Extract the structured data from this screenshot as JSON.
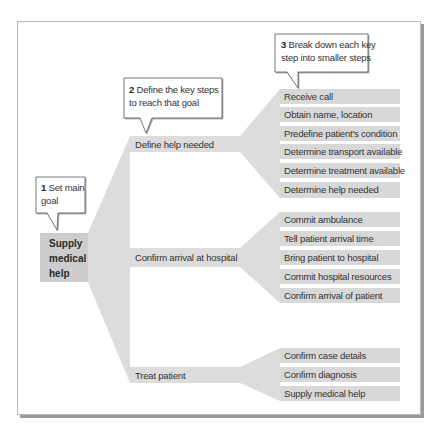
{
  "diagram": {
    "type": "hierarchical-task-breakdown",
    "main_goal": {
      "label_lines": [
        "Supply",
        "medical",
        "help"
      ]
    },
    "callouts": [
      {
        "number": "1",
        "text_line1": "Set main",
        "text_line2": "goal"
      },
      {
        "number": "2",
        "text_line1": "Define the key steps",
        "text_line2": "to reach that goal"
      },
      {
        "number": "3",
        "text_line1": "Break down each key",
        "text_line2": "step into smaller steps"
      }
    ],
    "key_steps": [
      {
        "label": "Define help needed",
        "substeps": [
          "Receive call",
          "Obtain name, location",
          "Predefine patient's condition",
          "Determine transport available",
          "Determine treatment available",
          "Determine help needed"
        ]
      },
      {
        "label": "Confirm arrival at hospital",
        "substeps": [
          "Commit ambulance",
          "Tell patient arrival time",
          "Bring patient to hospital",
          "Commit hospital resources",
          "Confirm arrival of patient"
        ]
      },
      {
        "label": "Treat patient",
        "substeps": [
          "Confirm case details",
          "Confirm diagnosis",
          "Supply medical help"
        ]
      }
    ],
    "colors": {
      "main_box": "#cdcdcd",
      "funnel": "#dcdcdc",
      "substep_box": "#d8d8d8",
      "callout_border": "#555555"
    }
  }
}
